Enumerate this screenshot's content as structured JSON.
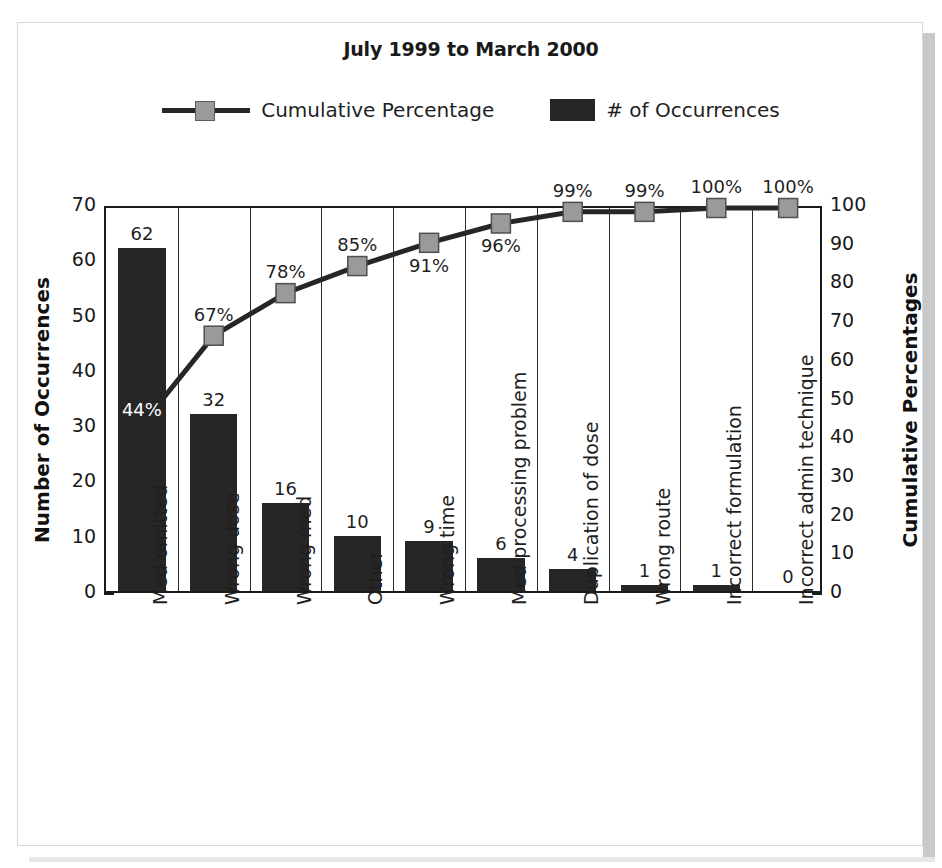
{
  "frame": {
    "border_color": "#d9d9d9",
    "shadow_color": "#c9c9c9"
  },
  "title": "July 1999 to March 2000",
  "legend": {
    "position": "top-center",
    "items": [
      {
        "label": "Cumulative Percentage",
        "type": "line-marker",
        "line_color": "#262626",
        "marker_color": "#9a9a9a"
      },
      {
        "label": "# of Occurrences",
        "type": "swatch",
        "color": "#262626"
      }
    ]
  },
  "axes": {
    "left": {
      "title": "Number of Occurrences",
      "ticks": [
        "70",
        "60",
        "50",
        "40",
        "30",
        "20",
        "10",
        "0"
      ],
      "min": 0,
      "max": 70,
      "step": 10
    },
    "right": {
      "title": "Cumulative Percentages",
      "ticks": [
        "100",
        "90",
        "80",
        "70",
        "60",
        "50",
        "40",
        "30",
        "20",
        "10",
        "0"
      ],
      "min": 0,
      "max": 100,
      "step": 10
    }
  },
  "chart_data": {
    "type": "bar",
    "title": "July 1999 to March 2000",
    "xlabel": "",
    "ylabel": "Number of Occurrences",
    "y2label": "Cumulative Percentages",
    "ylim": [
      0,
      70
    ],
    "y2lim": [
      0,
      100
    ],
    "grid": "vertical-category-separators",
    "legend_position": "top-center",
    "categories": [
      "Med omitted",
      "Wrong dose",
      "Wrong med",
      "Other",
      "Wrong time",
      "Med processing problem",
      "Duplication of dose",
      "Wrong route",
      "Incorrect formulation",
      "Incorrect admin technique"
    ],
    "series": [
      {
        "name": "# of Occurrences",
        "type": "bar",
        "axis": "left",
        "color": "#262626",
        "values": [
          62,
          32,
          16,
          10,
          9,
          6,
          4,
          1,
          1,
          0
        ],
        "labels": [
          "62",
          "32",
          "16",
          "10",
          "9",
          "6",
          "4",
          "1",
          "1",
          "0"
        ]
      },
      {
        "name": "Cumulative Percentage",
        "type": "line",
        "axis": "right",
        "color": "#262626",
        "marker_color": "#9a9a9a",
        "values": [
          44,
          67,
          78,
          85,
          91,
          96,
          99,
          99,
          100,
          100
        ],
        "labels": [
          "44%",
          "67%",
          "78%",
          "85%",
          "91%",
          "96%",
          "99%",
          "99%",
          "100%",
          "100%"
        ]
      }
    ],
    "total_occurrences": 141
  }
}
